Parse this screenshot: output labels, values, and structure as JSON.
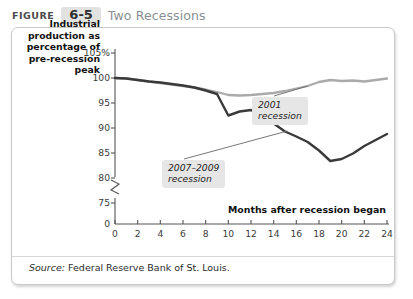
{
  "header": {
    "figure_word": "FIGURE",
    "figure_number": "6-5",
    "title": "Two Recessions"
  },
  "source": {
    "label": "Source:",
    "text": " Federal Reserve Bank of St. Louis."
  },
  "colors": {
    "line_2001": "#aaaaaa",
    "line_2007": "#3a3a3a",
    "axis": "#555555",
    "annotation_bg": "#e6e6e6",
    "badge_bg": "#e2e2e0",
    "title_gray": "#8a8f92"
  },
  "chart_data": {
    "type": "line",
    "title": "Two Recessions",
    "xlabel": "Months after recession began",
    "ylabel": "Industrial production as percentage of pre-recession peak",
    "ylabel_lines": [
      "Industrial",
      "production as",
      "percentage of",
      "pre-recession",
      "peak"
    ],
    "xlim": [
      0,
      24
    ],
    "ylim": [
      73,
      106
    ],
    "xticks": [
      0,
      2,
      4,
      6,
      8,
      10,
      12,
      14,
      16,
      18,
      20,
      22,
      24
    ],
    "xtick_labels": [
      "0",
      "2",
      "4",
      "6",
      "8",
      "10",
      "12",
      "14",
      "16",
      "18",
      "20",
      "22",
      "24"
    ],
    "yticks": [
      105,
      100,
      95,
      90,
      85,
      80,
      75
    ],
    "ytick_labels": [
      "105%",
      "100",
      "95",
      "90",
      "85",
      "80",
      "75"
    ],
    "y_axis_break": true,
    "y_origin_label": "0",
    "grid": false,
    "legend_position": "inline-annotations",
    "x": [
      0,
      1,
      2,
      3,
      4,
      5,
      6,
      7,
      8,
      9,
      10,
      11,
      12,
      13,
      14,
      15,
      16,
      17,
      18,
      19,
      20,
      21,
      22,
      23,
      24
    ],
    "series": [
      {
        "name": "2001 recession",
        "color": "#aaaaaa",
        "values": [
          100.0,
          99.9,
          99.6,
          99.3,
          99.0,
          98.7,
          98.4,
          98.1,
          97.7,
          97.2,
          96.6,
          96.5,
          96.6,
          96.8,
          97.0,
          97.4,
          97.9,
          98.4,
          99.2,
          99.6,
          99.4,
          99.5,
          99.3,
          99.6,
          99.9
        ]
      },
      {
        "name": "2007–2009 recession",
        "color": "#3a3a3a",
        "values": [
          100.0,
          99.9,
          99.6,
          99.3,
          99.1,
          98.8,
          98.5,
          98.1,
          97.5,
          96.8,
          92.5,
          93.3,
          93.6,
          92.3,
          90.9,
          89.3,
          88.3,
          87.2,
          85.5,
          83.4,
          83.8,
          84.9,
          86.4,
          87.6,
          88.8
        ]
      }
    ],
    "annotations": [
      {
        "id": "annot-2001",
        "lines": [
          "2001",
          "recession"
        ],
        "point_x": 17.0,
        "point_y": 98.4
      },
      {
        "id": "annot-2007",
        "lines": [
          "2007–2009",
          "recession"
        ],
        "point_x": 15.2,
        "point_y": 89.4
      }
    ]
  }
}
